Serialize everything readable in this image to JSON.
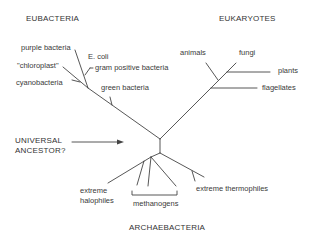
{
  "groups": {
    "eubacteria": "EUBACTERIA",
    "eukaryotes": "EUKARYOTES",
    "archaebacteria": "ARCHAEBACTERIA"
  },
  "eubacteria": {
    "purple_bacteria": "purple bacteria",
    "chloroplast": "\"chloroplast\"",
    "e_coli": "E. coli",
    "gram_positive": "gram positive bacteria",
    "cyanobacteria": "cyanobacteria",
    "green_bacteria": "green  bacteria"
  },
  "eukaryotes": {
    "animals": "animals",
    "fungi": "fungi",
    "plants": "plants",
    "flagellates": "flagellates"
  },
  "archaebacteria": {
    "halophiles_line1": "extreme",
    "halophiles_line2": "halophiles",
    "methanogens": "methanogens",
    "thermophiles": "extreme thermophiles"
  },
  "root": {
    "line1": "UNIVERSAL",
    "line2": "ANCESTOR?"
  },
  "colors": {
    "line": "#444444",
    "text": "#3a3a3a"
  }
}
